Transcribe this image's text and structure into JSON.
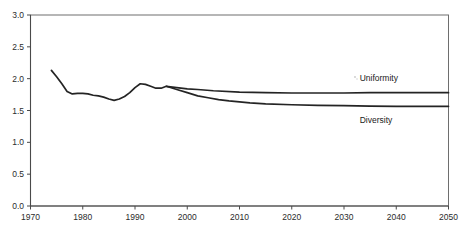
{
  "chart_data": {
    "type": "line",
    "title": "",
    "subtitle": "",
    "xlabel": "",
    "ylabel": "",
    "xlim": [
      1970,
      2050
    ],
    "ylim": [
      0.0,
      3.0
    ],
    "grid": false,
    "legend_position": "inline-right",
    "x_ticks": [
      1970,
      1980,
      1990,
      2000,
      2010,
      2020,
      2030,
      2040,
      2050
    ],
    "x_tick_labels": [
      "1970",
      "1980",
      "1990",
      "2000",
      "2010",
      "2020",
      "2030",
      "2040",
      "2050"
    ],
    "y_ticks": [
      0.0,
      0.5,
      1.0,
      1.5,
      2.0,
      2.5,
      3.0
    ],
    "y_tick_labels": [
      "0.0",
      "0.5",
      "1.0",
      "1.5",
      "2.0",
      "2.5",
      "3.0"
    ],
    "annotations": [
      {
        "name": "uniformity-label",
        "text": "Uniformity",
        "x": 2033,
        "y": 1.96
      },
      {
        "name": "diversity-label",
        "text": "Diversity",
        "x": 2033,
        "y": 1.3
      }
    ],
    "series": [
      {
        "name": "Uniformity",
        "color": "#242424",
        "x": [
          1974,
          1975,
          1976,
          1977,
          1978,
          1979,
          1980,
          1981,
          1982,
          1983,
          1984,
          1985,
          1986,
          1987,
          1988,
          1989,
          1990,
          1991,
          1992,
          1993,
          1994,
          1995,
          1996,
          1998,
          2000,
          2002,
          2005,
          2010,
          2015,
          2020,
          2025,
          2030,
          2035,
          2040,
          2045,
          2050
        ],
        "values": [
          2.13,
          2.03,
          1.92,
          1.8,
          1.76,
          1.77,
          1.77,
          1.76,
          1.74,
          1.73,
          1.71,
          1.68,
          1.66,
          1.68,
          1.72,
          1.78,
          1.86,
          1.92,
          1.91,
          1.88,
          1.85,
          1.85,
          1.88,
          1.86,
          1.84,
          1.83,
          1.81,
          1.79,
          1.78,
          1.775,
          1.775,
          1.775,
          1.78,
          1.78,
          1.78,
          1.78
        ]
      },
      {
        "name": "Diversity",
        "color": "#242424",
        "x": [
          1996,
          1998,
          2000,
          2002,
          2004,
          2006,
          2008,
          2010,
          2012,
          2015,
          2020,
          2025,
          2030,
          2035,
          2040,
          2045,
          2050
        ],
        "values": [
          1.88,
          1.83,
          1.78,
          1.73,
          1.7,
          1.67,
          1.65,
          1.635,
          1.62,
          1.605,
          1.59,
          1.58,
          1.575,
          1.57,
          1.565,
          1.565,
          1.565
        ]
      }
    ]
  },
  "axis": {
    "y_axis_name": "value-axis",
    "x_axis_name": "year-axis"
  }
}
